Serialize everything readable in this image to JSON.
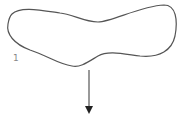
{
  "diagram": {
    "shape_label": "1",
    "stroke_color": "#555555",
    "arrow_color": "#222222",
    "label_color": "#888888"
  }
}
